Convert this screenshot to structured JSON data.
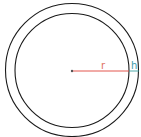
{
  "diagram": {
    "type": "concentric-circles",
    "labels": {
      "radius": "r",
      "thickness": "h"
    },
    "colors": {
      "circle_stroke": "#1a1a1a",
      "radius_line": "#e0443a",
      "radius_label": "#e07060",
      "thickness_line": "#3aa0a0",
      "thickness_label": "#3a9aa8",
      "center_point": "#555555"
    },
    "geometry": {
      "center": [
        72,
        70
      ],
      "outer_radius": 66.5,
      "inner_radius": 57
    }
  }
}
